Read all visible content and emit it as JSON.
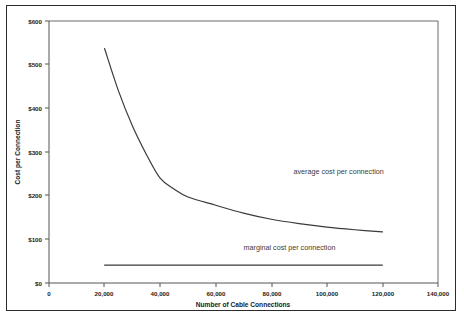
{
  "chart_data": {
    "type": "line",
    "title": "",
    "xlabel": "Number of Cable Connections",
    "ylabel": "Cost per Connection",
    "xlim": [
      0,
      140000
    ],
    "ylim": [
      0,
      600
    ],
    "grid": false,
    "legend_position": "inline-annotation",
    "x_ticks": [
      0,
      20000,
      40000,
      60000,
      80000,
      100000,
      120000,
      140000
    ],
    "x_tick_labels": [
      "0",
      "20,000",
      "40,000",
      "60,000",
      "80,000",
      "100,000",
      "120,000",
      "140,000"
    ],
    "y_ticks": [
      0,
      100,
      200,
      300,
      400,
      500,
      600
    ],
    "y_tick_labels": [
      "$0",
      "$100",
      "$200",
      "$300",
      "$400",
      "$500",
      "$600"
    ],
    "series": [
      {
        "name": "average cost per connection",
        "annotation": "average cost per connection",
        "annotation_x": 88000,
        "annotation_y": 250,
        "x": [
          20000,
          25000,
          30000,
          35000,
          40000,
          45000,
          50000,
          60000,
          70000,
          80000,
          90000,
          100000,
          110000,
          120000
        ],
        "values": [
          537,
          440,
          360,
          295,
          240,
          215,
          197,
          178,
          160,
          146,
          136,
          128,
          122,
          117
        ]
      },
      {
        "name": "marginal cost per connection",
        "annotation": "marginal cost per connection",
        "annotation_x": 70000,
        "annotation_y": 75,
        "x": [
          20000,
          120000
        ],
        "values": [
          41,
          41
        ]
      }
    ]
  },
  "colors": {
    "line": "#3a3a3a",
    "axis": "#555555",
    "frame": "#2b2b2b",
    "text": "#1a1a1a",
    "annotation_text": "#3a3a3a",
    "background": "#ffffff"
  }
}
